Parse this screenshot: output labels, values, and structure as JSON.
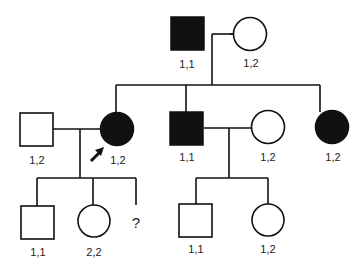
{
  "pedigree": {
    "generation1": {
      "father": {
        "sex": "male",
        "affected": true,
        "genotype": "1,1"
      },
      "mother": {
        "sex": "female",
        "affected": false,
        "genotype": "1,2"
      }
    },
    "generation2": {
      "spouse_of_proband": {
        "sex": "male",
        "affected": false,
        "genotype": "1,2"
      },
      "proband": {
        "sex": "female",
        "affected": true,
        "genotype": "1,2",
        "marker": "proband-arrow"
      },
      "brother": {
        "sex": "male",
        "affected": true,
        "genotype": "1,1"
      },
      "brother_spouse": {
        "sex": "female",
        "affected": false,
        "genotype": "1,2"
      },
      "sister": {
        "sex": "female",
        "affected": true,
        "genotype": "1,2"
      }
    },
    "generation3": {
      "proband_son": {
        "sex": "male",
        "affected": false,
        "genotype": "1,1"
      },
      "proband_daughter": {
        "sex": "female",
        "affected": false,
        "genotype": "2,2"
      },
      "unknown_child": {
        "label": "?"
      },
      "brother_son": {
        "sex": "male",
        "affected": false,
        "genotype": "1,1"
      },
      "brother_daughter": {
        "sex": "female",
        "affected": false,
        "genotype": "1,2"
      }
    }
  }
}
